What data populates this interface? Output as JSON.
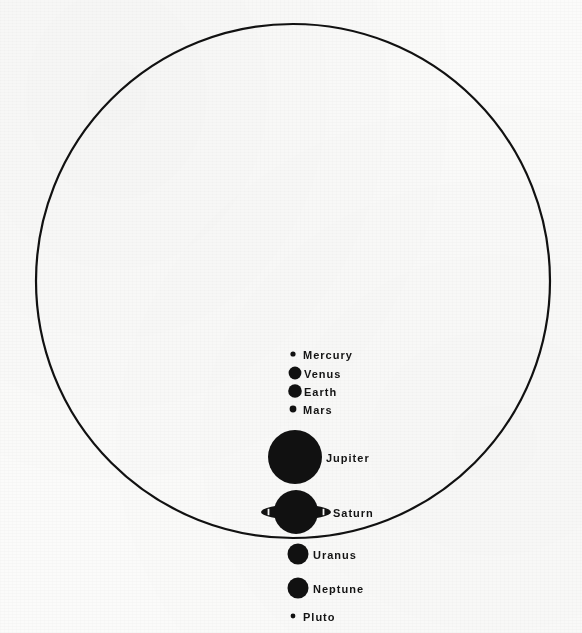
{
  "figure": {
    "caption": "",
    "colors": {
      "ink": "#111111",
      "paper": "#fbfbfa"
    },
    "sun": {
      "name": "Sun",
      "label": "",
      "cx": 293,
      "cy": 281,
      "r": 257,
      "stroke_width": 2.2
    },
    "planets": [
      {
        "name": "Mercury",
        "label": "Mercury",
        "shape": "dot",
        "cx": 293,
        "cy": 354,
        "r": 2.6,
        "label_x": 303,
        "label_y": 350
      },
      {
        "name": "Venus",
        "label": "Venus",
        "shape": "dot",
        "cx": 295,
        "cy": 373,
        "r": 6.4,
        "label_x": 304,
        "label_y": 369
      },
      {
        "name": "Earth",
        "label": "Earth",
        "shape": "dot",
        "cx": 295,
        "cy": 391,
        "r": 6.8,
        "label_x": 304,
        "label_y": 387
      },
      {
        "name": "Mars",
        "label": "Mars",
        "shape": "dot",
        "cx": 293,
        "cy": 409,
        "r": 3.4,
        "label_x": 303,
        "label_y": 405
      },
      {
        "name": "Jupiter",
        "label": "Jupiter",
        "shape": "dot",
        "cx": 295,
        "cy": 457,
        "r": 27,
        "label_x": 326,
        "label_y": 453
      },
      {
        "name": "Saturn",
        "label": "Saturn",
        "shape": "ringed",
        "cx": 296,
        "cy": 512,
        "r": 22,
        "ring_rx": 35,
        "ring_ry": 7.5,
        "label_x": 333,
        "label_y": 508
      },
      {
        "name": "Uranus",
        "label": "Uranus",
        "shape": "dot",
        "cx": 298,
        "cy": 554,
        "r": 10.5,
        "label_x": 313,
        "label_y": 550
      },
      {
        "name": "Neptune",
        "label": "Neptune",
        "shape": "dot",
        "cx": 298,
        "cy": 588,
        "r": 10.5,
        "label_x": 313,
        "label_y": 584
      },
      {
        "name": "Pluto",
        "label": "Pluto",
        "shape": "dot",
        "cx": 293,
        "cy": 616,
        "r": 2.4,
        "label_x": 303,
        "label_y": 612
      }
    ]
  }
}
